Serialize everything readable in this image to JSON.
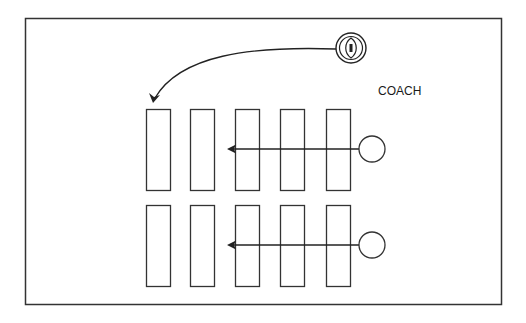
{
  "diagram": {
    "labels": {
      "coach": "COACH"
    },
    "colors": {
      "stroke": "#333333",
      "background": "#ffffff"
    },
    "rows": [
      {
        "name": "row-1",
        "bags": 5,
        "player": {
          "icon": "player-circle",
          "arrow_passes_bags": 3
        }
      },
      {
        "name": "row-2",
        "bags": 5,
        "player": {
          "icon": "player-circle",
          "arrow_passes_bags": 3
        }
      }
    ],
    "ball": {
      "icon": "football-icon",
      "pass_target": "row-1 bag 1"
    }
  }
}
